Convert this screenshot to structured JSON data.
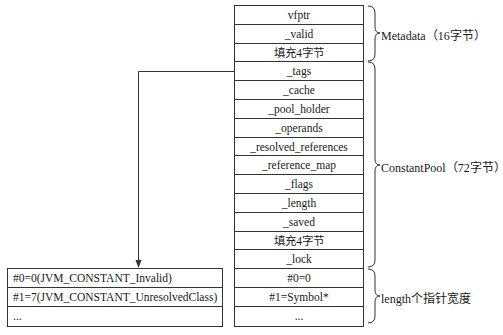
{
  "main_table": {
    "rows": [
      "vfptr",
      "_valid",
      "填充4字节",
      "_tags",
      "_cache",
      "_pool_holder",
      "_operands",
      "_resolved_references",
      "_reference_map",
      "_flags",
      "_length",
      "_saved",
      "填充4字节",
      "_lock",
      "#0=0",
      "#1=Symbol*",
      "..."
    ]
  },
  "entry_table": {
    "rows": [
      "#0=0(JVM_CONSTANT_Invalid)",
      "#1=7(JVM_CONSTANT_UnresolvedClass)",
      "..."
    ]
  },
  "braces": {
    "metadata": "Metadata（16字节）",
    "constant_pool": "ConstantPool（72字节）",
    "pointers": "length个指针宽度"
  },
  "arrow": {
    "from": "_tags",
    "to": "entry_table"
  }
}
